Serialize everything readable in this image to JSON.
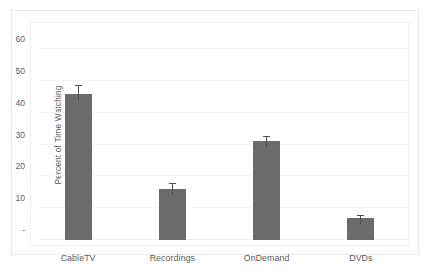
{
  "chart_data": {
    "type": "bar",
    "title": "",
    "subtitle": "",
    "xlabel": "",
    "ylabel": "Percent of Time Watching",
    "categories": [
      "CableTV",
      "Recordings",
      "OnDemand",
      "DVDs"
    ],
    "values": [
      46,
      16,
      31,
      7
    ],
    "errors": [
      2.5,
      1.5,
      1.5,
      0.7
    ],
    "series": [
      {
        "name": "Percent of Time Watching",
        "values": [
          46,
          16,
          31,
          7
        ],
        "errors": [
          2.5,
          1.5,
          1.5,
          0.7
        ]
      }
    ],
    "ylim": [
      0,
      60
    ],
    "ytick_values": [
      0,
      10,
      20,
      30,
      40,
      50,
      60
    ],
    "ytick_labels": [
      "-",
      "10",
      "20",
      "30",
      "40",
      "50",
      "60"
    ],
    "grid": true,
    "grid_axis": "y",
    "legend": false,
    "legend_position": "none",
    "error_bars": true,
    "bar_color": "#6b6b6b",
    "errorbar_color": "#4f4f4f",
    "gridline_color": "#f4f4f4",
    "axis_text_color": "#5a5a5a",
    "plot_background": "#ffffff",
    "frame_border_color": "#e8e8e8"
  }
}
